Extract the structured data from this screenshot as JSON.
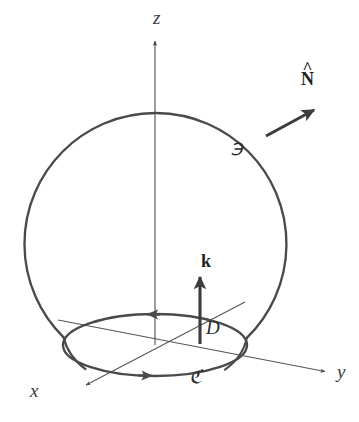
{
  "figure": {
    "kind": "vector-calculus-diagram",
    "canvas": {
      "width": 359,
      "height": 422,
      "background": "#ffffff"
    },
    "colors": {
      "outline": "#4a4a4a",
      "thin_line": "#555555",
      "vector": "#3c3c3c",
      "text": "#2b2b2b"
    }
  },
  "labels": {
    "axis_z": "z",
    "axis_x": "x",
    "axis_y": "y",
    "normal_vector": "N",
    "normal_vector_accent": "^",
    "unit_vector_k": "k",
    "surface": "℈",
    "disk": "D",
    "curve": "ℭ"
  },
  "geometry": {
    "sphere": {
      "cx": 155,
      "cy": 226,
      "r": 131
    },
    "equator_ellipse": {
      "cx": 155,
      "cy": 345,
      "rx": 92,
      "ry": 31
    },
    "z_axis": {
      "x": 155,
      "y_top": 40,
      "y_bottom": 345
    },
    "x_axis": {
      "x1": 243,
      "y1": 303,
      "x2": 85,
      "y2": 386
    },
    "y_axis": {
      "x1": 60,
      "y1": 320,
      "x2": 327,
      "y2": 372
    },
    "k_vector": {
      "x": 200,
      "y_base": 343,
      "y_tip": 276
    },
    "n_vector": {
      "x1": 268,
      "y1": 134,
      "x2": 314,
      "y2": 110
    }
  },
  "label_positions": {
    "axis_z": {
      "left": 153,
      "top": 8
    },
    "axis_x": {
      "left": 30,
      "top": 382
    },
    "axis_y": {
      "left": 337,
      "top": 363
    },
    "normal_vector": {
      "left": 303,
      "top": 72
    },
    "unit_vector_k": {
      "left": 202,
      "top": 253
    },
    "surface": {
      "left": 231,
      "top": 140
    },
    "disk": {
      "left": 207,
      "top": 319
    },
    "curve": {
      "left": 189,
      "top": 368
    }
  }
}
